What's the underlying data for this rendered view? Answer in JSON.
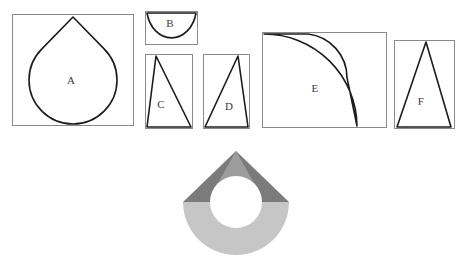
{
  "figure": {
    "canvas": {
      "width": 469,
      "height": 278,
      "background": "#ffffff"
    },
    "stroke_color": "#1c1c1c",
    "frame_color": "#8a8a8a"
  },
  "pieces": [
    {
      "label": "A",
      "name": "teardrop-piece",
      "description": "270-degree circular sector closed by two straight sides meeting at an apex above the circle",
      "frame": {
        "x": 12,
        "y": 14,
        "width": 122,
        "height": 112
      },
      "label_pos": {
        "x": 71,
        "y": 81
      }
    },
    {
      "label": "B",
      "name": "half-disc-piece",
      "description": "semicircular half disc with the flat diameter along the top edge",
      "frame": {
        "x": 145,
        "y": 11,
        "width": 53,
        "height": 34
      },
      "label_pos": {
        "x": 169,
        "y": 23
      }
    },
    {
      "label": "C",
      "name": "triangle-piece-c",
      "description": "obtuse triangle with apex at top-left and base along the bottom edge",
      "frame": {
        "x": 145,
        "y": 54,
        "width": 48,
        "height": 75
      },
      "label_pos": {
        "x": 161,
        "y": 104
      }
    },
    {
      "label": "D",
      "name": "triangle-piece-d",
      "description": "obtuse triangle with apex at top-right and base along the bottom edge",
      "frame": {
        "x": 203,
        "y": 54,
        "width": 47,
        "height": 75
      },
      "label_pos": {
        "x": 229,
        "y": 106
      }
    },
    {
      "label": "E",
      "name": "annular-sector-piece",
      "description": "quarter annulus (curved band) with its centre at the top-left corner of the frame",
      "frame": {
        "x": 262,
        "y": 32,
        "width": 125,
        "height": 96
      },
      "label_pos": {
        "x": 314,
        "y": 88
      }
    },
    {
      "label": "F",
      "name": "triangle-piece-f",
      "description": "tall isosceles triangle with apex at the top and base along the bottom edge",
      "frame": {
        "x": 394,
        "y": 40,
        "width": 61,
        "height": 89
      },
      "label_pos": {
        "x": 421,
        "y": 101
      }
    }
  ],
  "assembly": {
    "name": "assembled-teardrop",
    "description": "Assembled figure: a light grey half disc and two dark grey triangular wings forming a cone above it, with a white circular hole in the middle",
    "colors": {
      "dark_gray": "#7b7b7b",
      "mid_gray": "#9d9d9d",
      "light_gray": "#c6c6c6",
      "hole": "#ffffff"
    },
    "geometry": {
      "apex": {
        "x": 236,
        "y": 151
      },
      "center": {
        "x": 236,
        "y": 202
      },
      "outer_radius": 53,
      "hole_radius": 26,
      "cone_left": {
        "x": 183,
        "y": 202
      },
      "cone_right": {
        "x": 289,
        "y": 202
      }
    }
  }
}
